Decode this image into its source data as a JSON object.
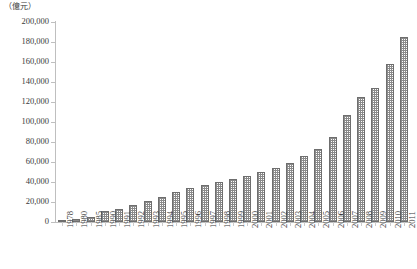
{
  "unit_label": "（億元）",
  "chart_data": {
    "type": "bar",
    "title": "",
    "subtitle": "",
    "xlabel": "",
    "ylabel": "",
    "unit": "億元",
    "grid": false,
    "legend": null,
    "ylim": [
      0,
      200000
    ],
    "ytick_step": 20000,
    "ytick_labels": [
      "200,000",
      "180,000",
      "160,000",
      "140,000",
      "120,000",
      "100,000",
      "80,000",
      "60,000",
      "40,000",
      "20,000",
      "0"
    ],
    "ytick_values": [
      200000,
      180000,
      160000,
      140000,
      120000,
      100000,
      80000,
      60000,
      40000,
      20000,
      0
    ],
    "categories": [
      "1978",
      "1980",
      "1985",
      "1990",
      "1991",
      "1992",
      "1993",
      "1994",
      "1995",
      "1996",
      "1997",
      "1998",
      "1999",
      "2000",
      "2001",
      "2002",
      "2003",
      "2004",
      "2005",
      "2006",
      "2007",
      "2008",
      "2009",
      "2010",
      "2011"
    ],
    "values": [
      3645,
      4546,
      9016,
      18668,
      21781,
      26923,
      35334,
      48198,
      60794,
      71177,
      78973,
      84402,
      89677,
      99215,
      109655,
      120333,
      135823,
      159878,
      184937,
      216314,
      265810,
      314045,
      340903,
      401513,
      473104
    ],
    "bar_values_scaled": [
      3645,
      4546,
      9016,
      18668,
      21781,
      26923,
      35334,
      48198,
      60794,
      71177,
      78973,
      84402,
      89677,
      99215,
      109655,
      120333,
      135823,
      159878,
      184937,
      216314,
      265810,
      314045,
      340903,
      401513,
      473104
    ],
    "series": [
      {
        "name": "GDP",
        "values": [
          2000,
          3000,
          5500,
          11000,
          13000,
          17000,
          21000,
          25000,
          30000,
          34000,
          37000,
          40000,
          43000,
          46000,
          50000,
          54000,
          59000,
          66000,
          73000,
          85000,
          107000,
          125000,
          134000,
          158000,
          185000
        ]
      }
    ],
    "plot_values": [
      2000,
      3000,
      5500,
      11000,
      13000,
      17000,
      21000,
      25000,
      30000,
      34000,
      37000,
      40000,
      43000,
      46000,
      50000,
      54000,
      59000,
      66000,
      73000,
      85000,
      107000,
      125000,
      134000,
      158000,
      185000
    ],
    "colors": {
      "bar_fill": "#8a8a8a",
      "bar_border": "#6e6e6e",
      "axis": "#bfbfbf",
      "text": "#3a3a3a",
      "background": "#ffffff"
    }
  }
}
